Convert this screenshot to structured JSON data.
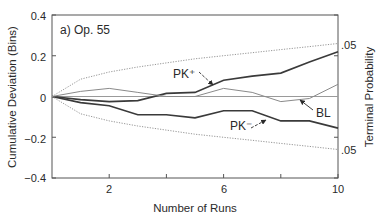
{
  "chart_data": {
    "type": "line",
    "title": "a) Op. 55",
    "xlabel": "Number of Runs",
    "ylabel": "Cumulative Deviation (Bins)",
    "ylabel_right": "Terminal Probability",
    "xlim": [
      0,
      10
    ],
    "ylim": [
      -0.4,
      0.4
    ],
    "x_ticks": [
      2,
      4,
      6,
      8,
      10
    ],
    "x_tick_labels": [
      "2",
      "",
      "6",
      "",
      "10"
    ],
    "y_ticks": [
      0.4,
      0.2,
      0,
      -0.2,
      -0.4
    ],
    "y_tick_labels": [
      "0.4",
      "0.2",
      "0",
      "−0.2",
      "−0.4"
    ],
    "right_tick_labels": [
      {
        "label": ".05",
        "series": "upper_bound"
      },
      {
        "label": ".05",
        "series": "lower_bound"
      }
    ],
    "grid": false,
    "x": [
      0,
      1,
      2,
      3,
      4,
      5,
      6,
      7,
      8,
      9,
      10
    ],
    "series": [
      {
        "name": "PK+",
        "label": "PK⁺",
        "style": "solid-dark",
        "values": [
          0,
          -0.015,
          -0.025,
          -0.02,
          0.015,
          0.02,
          0.08,
          0.1,
          0.115,
          0.17,
          0.22
        ]
      },
      {
        "name": "PK-",
        "label": "PK⁻",
        "style": "solid-dark",
        "values": [
          0,
          -0.03,
          -0.045,
          -0.09,
          -0.09,
          -0.105,
          -0.07,
          -0.07,
          -0.12,
          -0.12,
          -0.155
        ]
      },
      {
        "name": "BL",
        "label": "BL",
        "style": "solid-light",
        "values": [
          0,
          0.025,
          0.04,
          0.02,
          0,
          0,
          0.04,
          0.02,
          -0.025,
          -0.01,
          0.06
        ]
      },
      {
        "name": "upper_bound",
        "label": ".05",
        "style": "dotted",
        "values": [
          0,
          0.085,
          0.12,
          0.145,
          0.165,
          0.185,
          0.2,
          0.215,
          0.23,
          0.245,
          0.26
        ]
      },
      {
        "name": "lower_bound",
        "label": ".05",
        "style": "dotted",
        "values": [
          0,
          -0.085,
          -0.12,
          -0.145,
          -0.165,
          -0.185,
          -0.2,
          -0.215,
          -0.23,
          -0.245,
          -0.26
        ]
      }
    ],
    "annotations": [
      {
        "text": "PK⁺",
        "points_to": "PK+",
        "at_run": 4.5
      },
      {
        "text": "BL",
        "points_to": "BL",
        "at_run": 8.3
      },
      {
        "text": "PK⁻",
        "points_to": "PK-",
        "at_run": 6.8
      }
    ]
  },
  "colors": {
    "axis": "#555555",
    "dark_line": "#3a3a3a",
    "light_line": "#8a8a8a",
    "baseline": "#9a9a9a",
    "dotted": "#8a8a8a"
  }
}
